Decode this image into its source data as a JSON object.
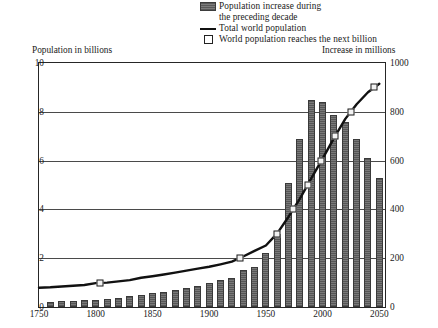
{
  "legend": {
    "items": [
      {
        "key": "bar-swatch",
        "label": "Population increase during",
        "label2": "the preceding decade"
      },
      {
        "key": "line-swatch",
        "label": "Total world population"
      },
      {
        "key": "square-swatch",
        "label": "World population reaches the next billion"
      }
    ]
  },
  "axes": {
    "left_caption": "Population in billions",
    "right_caption": "Increase in millions",
    "y_left_ticks": [
      "0",
      "2",
      "4",
      "6",
      "8",
      "10"
    ],
    "y_right_ticks": [
      "0",
      "200",
      "400",
      "600",
      "800",
      "1000"
    ],
    "x_ticks": [
      "1750",
      "1800",
      "1850",
      "1900",
      "1950",
      "2000",
      "2050"
    ]
  },
  "colors": {
    "bar_fill": "#6b6b6b",
    "bar_edge": "#3a3a3a",
    "line": "#111111",
    "marker_fill": "#f2f2f2",
    "marker_edge": "#1d1d1d",
    "grid": "#4a4a4a",
    "frame": "#262626",
    "background": "#ffffff"
  },
  "chart_data": {
    "type": "bar",
    "title": "",
    "xlabel": "",
    "ylabel": "Population in billions",
    "y2label": "Increase in millions",
    "xlim": [
      1750,
      2055
    ],
    "ylim": [
      0,
      10
    ],
    "y2lim": [
      0,
      1000
    ],
    "grid": true,
    "legend_position": "top-right",
    "series": [
      {
        "name": "Population increase during the preceding decade",
        "type": "bar",
        "axis": "right",
        "unit": "millions",
        "x": [
          1760,
          1770,
          1780,
          1790,
          1800,
          1810,
          1820,
          1830,
          1840,
          1850,
          1860,
          1870,
          1880,
          1890,
          1900,
          1910,
          1920,
          1930,
          1940,
          1950,
          1960,
          1970,
          1980,
          1990,
          2000,
          2010,
          2020,
          2030,
          2040,
          2050
        ],
        "values": [
          22,
          24,
          26,
          28,
          30,
          34,
          38,
          44,
          50,
          56,
          62,
          70,
          78,
          88,
          100,
          112,
          120,
          150,
          165,
          220,
          300,
          510,
          690,
          850,
          840,
          785,
          760,
          690,
          610,
          530
        ]
      },
      {
        "name": "Total world population",
        "type": "line",
        "axis": "left",
        "unit": "billions",
        "x": [
          1750,
          1760,
          1770,
          1780,
          1790,
          1800,
          1810,
          1820,
          1830,
          1840,
          1850,
          1860,
          1870,
          1880,
          1890,
          1900,
          1910,
          1920,
          1930,
          1940,
          1950,
          1960,
          1970,
          1980,
          1990,
          2000,
          2010,
          2020,
          2030,
          2040,
          2050
        ],
        "values": [
          0.79,
          0.81,
          0.84,
          0.87,
          0.9,
          0.98,
          1.0,
          1.05,
          1.1,
          1.2,
          1.26,
          1.33,
          1.41,
          1.49,
          1.57,
          1.65,
          1.75,
          1.86,
          2.07,
          2.3,
          2.52,
          3.02,
          3.7,
          4.44,
          5.27,
          6.08,
          6.92,
          7.71,
          8.31,
          8.8,
          9.15
        ]
      }
    ],
    "annotations": {
      "name": "World population reaches the next billion",
      "points": [
        {
          "label": "1 billion",
          "x": 1804,
          "y": 1.0
        },
        {
          "label": "2 billion",
          "x": 1927,
          "y": 2.0
        },
        {
          "label": "3 billion",
          "x": 1960,
          "y": 3.0
        },
        {
          "label": "4 billion",
          "x": 1974,
          "y": 4.0
        },
        {
          "label": "5 billion",
          "x": 1987,
          "y": 5.0
        },
        {
          "label": "6 billion",
          "x": 1999,
          "y": 6.0
        },
        {
          "label": "7 billion",
          "x": 2011,
          "y": 7.0
        },
        {
          "label": "8 billion",
          "x": 2025,
          "y": 8.0
        },
        {
          "label": "9 billion",
          "x": 2045,
          "y": 9.0
        }
      ]
    }
  }
}
